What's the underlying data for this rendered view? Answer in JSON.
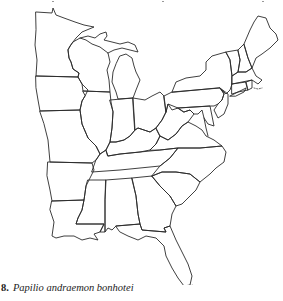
{
  "figure": {
    "number": "8.",
    "species_name": "Papilio andraemon bonhotei",
    "map_region": "Eastern United States outline map"
  },
  "colors": {
    "background": "#ffffff",
    "outline": "#2a2a2a",
    "caption_text": "#222222"
  }
}
